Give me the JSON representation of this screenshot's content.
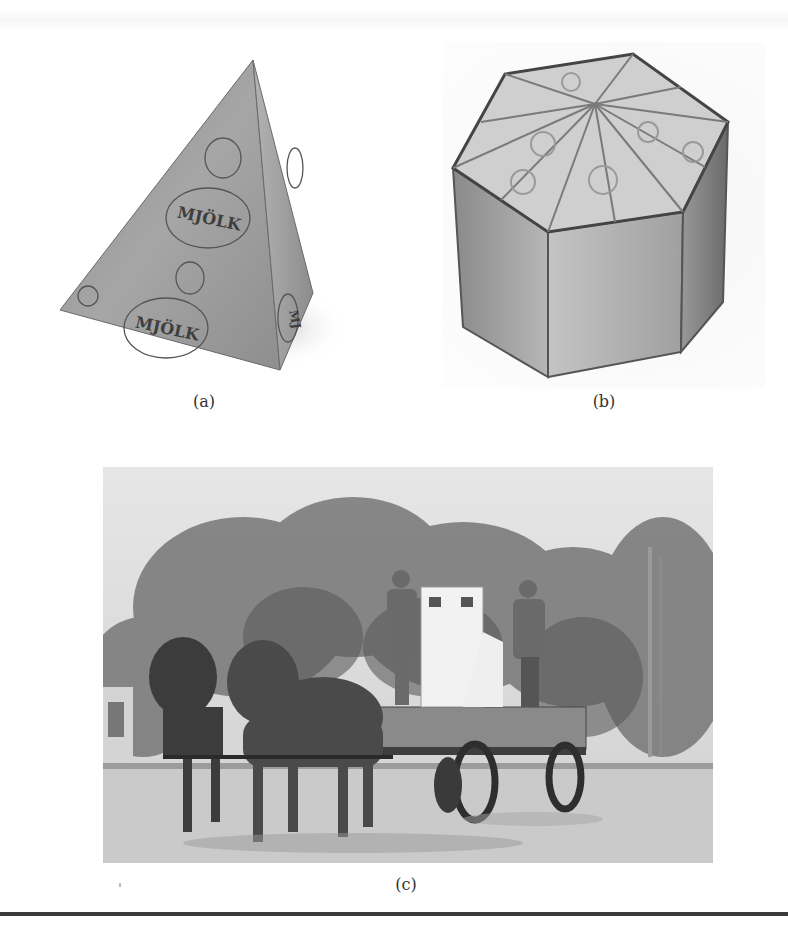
{
  "figure": {
    "panels": [
      {
        "id": "a",
        "caption": "(a)",
        "description": "Tetrahedral milk carton printed with MJÖLK labels",
        "print_text": [
          "MJÖLK",
          "MJÖLK",
          "MJ"
        ]
      },
      {
        "id": "b",
        "caption": "(b)",
        "description": "Hexagonal crate holding tetrahedral packages"
      },
      {
        "id": "c",
        "caption": "(c)",
        "description": "Historic photo of a horse-drawn wagon with two men and a white delivery cabinet"
      }
    ]
  }
}
